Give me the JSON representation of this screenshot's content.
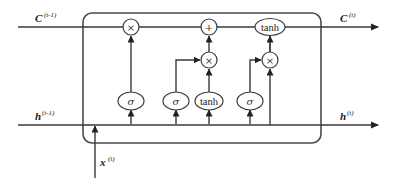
{
  "diagram": {
    "type": "lstm-cell",
    "labels": {
      "c_prev": {
        "base": "C",
        "sup": "(t-1)"
      },
      "c_next": {
        "base": "C",
        "sup": "(t)"
      },
      "h_prev": {
        "base": "h",
        "sup": "(t-1)"
      },
      "h_next": {
        "base": "h",
        "sup": "(t)"
      },
      "x_in": {
        "base": "x",
        "sup": "(t)"
      }
    },
    "nodes": {
      "forget_mult": "×",
      "cell_add": "+",
      "cell_tanh": "tanh",
      "input_mult": "×",
      "output_mult": "×",
      "forget_gate": "σ",
      "input_gate": "σ",
      "candidate": "tanh",
      "output_gate": "σ"
    }
  }
}
